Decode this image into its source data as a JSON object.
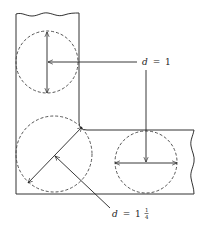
{
  "diagram": {
    "type": "L-shaped section with inscribed circles",
    "labels": {
      "top_label": {
        "var": "d",
        "eq": "=",
        "value": "1"
      },
      "bottom_label": {
        "var": "d",
        "eq": "=",
        "value_whole": "1",
        "value_num": "1",
        "value_den": "4"
      }
    },
    "circles": [
      {
        "name": "upper-leg-circle",
        "cx": 47,
        "cy": 62,
        "r": 31,
        "diameter_label": "d = 1"
      },
      {
        "name": "corner-circle",
        "cx": 54,
        "cy": 154,
        "r": 38,
        "diameter_label": "d = 1¼"
      },
      {
        "name": "horizontal-leg-circle",
        "cx": 146,
        "cy": 162,
        "r": 31,
        "diameter_label": "d = 1"
      }
    ],
    "colors": {
      "line": "#333333",
      "background": "#ffffff"
    }
  }
}
